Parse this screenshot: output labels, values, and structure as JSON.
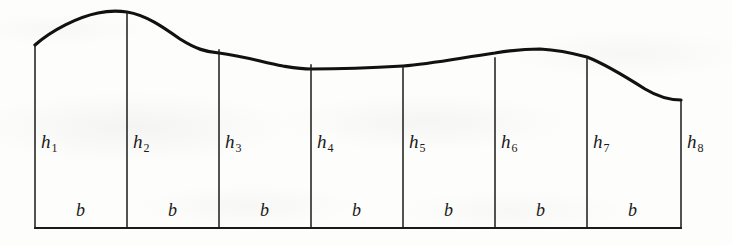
{
  "figure": {
    "colors": {
      "ink": "#111111",
      "paper": "#fdfdfc",
      "curve": "#111111",
      "divider": "#1a1a1a"
    },
    "geometry": {
      "baseline_y": 228,
      "left_edge_x": 35,
      "right_edge_x": 681,
      "strip_width_px": 92,
      "strip_count": 7,
      "ordinate_count": 8,
      "ordinate_x": [
        35,
        127,
        219,
        311,
        403,
        495,
        587,
        681
      ],
      "curve_y_at_ordinate": [
        45,
        12,
        50,
        65,
        66,
        58,
        57,
        100
      ],
      "curve_path": "M 35 45 C 52 30, 78 17, 98 13 C 112 10, 120 11, 127 12 C 146 15, 163 27, 180 39 C 196 49, 206 52, 219 53 C 243 56, 262 62, 283 66 C 296 68, 302 69, 311 69 C 340 69, 370 68, 403 66 C 430 64, 460 58, 495 53 C 512 50, 525 49, 540 49 C 558 50, 572 53, 587 57 C 605 64, 623 75, 645 89 C 660 98, 672 100, 681 100",
      "curve_stroke_width": 3.2,
      "divider_stroke_width": 1.5,
      "baseline_stroke_width": 1.8
    },
    "height_labels": [
      {
        "name": "h1",
        "base": "h",
        "sub": "1",
        "x": 41,
        "y": 132
      },
      {
        "name": "h2",
        "base": "h",
        "sub": "2",
        "x": 133,
        "y": 132
      },
      {
        "name": "h3",
        "base": "h",
        "sub": "3",
        "x": 225,
        "y": 132
      },
      {
        "name": "h4",
        "base": "h",
        "sub": "4",
        "x": 317,
        "y": 132
      },
      {
        "name": "h5",
        "base": "h",
        "sub": "5",
        "x": 409,
        "y": 132
      },
      {
        "name": "h6",
        "base": "h",
        "sub": "6",
        "x": 501,
        "y": 132
      },
      {
        "name": "h7",
        "base": "h",
        "sub": "7",
        "x": 593,
        "y": 132
      },
      {
        "name": "h8",
        "base": "h",
        "sub": "8",
        "x": 687,
        "y": 132
      }
    ],
    "width_labels": [
      {
        "name": "b1",
        "text": "b",
        "x": 76,
        "y": 201
      },
      {
        "name": "b2",
        "text": "b",
        "x": 168,
        "y": 201
      },
      {
        "name": "b3",
        "text": "b",
        "x": 260,
        "y": 201
      },
      {
        "name": "b4",
        "text": "b",
        "x": 352,
        "y": 201
      },
      {
        "name": "b5",
        "text": "b",
        "x": 444,
        "y": 201
      },
      {
        "name": "b6",
        "text": "b",
        "x": 536,
        "y": 201
      },
      {
        "name": "b7",
        "text": "b",
        "x": 628,
        "y": 201
      }
    ]
  }
}
